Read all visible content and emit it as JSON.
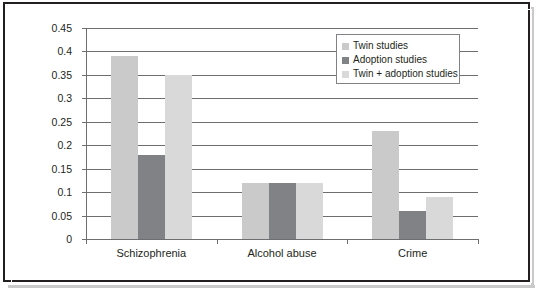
{
  "chart_data": {
    "type": "bar",
    "title": "",
    "subtitle": "",
    "xlabel": "",
    "ylabel": "",
    "categories": [
      "Schizophrenia",
      "Alcohol abuse",
      "Crime"
    ],
    "series": [
      {
        "name": "Twin studies",
        "values": [
          0.39,
          0.12,
          0.23
        ],
        "color": "#cacaca"
      },
      {
        "name": "Adoption studies",
        "values": [
          0.18,
          0.12,
          0.06
        ],
        "color": "#808285"
      },
      {
        "name": "Twin + adoption studies",
        "values": [
          0.35,
          0.12,
          0.09
        ],
        "color": "#d9d9d9"
      }
    ],
    "ylim": [
      0,
      0.45
    ],
    "ytick_labels": [
      "0",
      "0.05",
      "0.1",
      "0.15",
      "0.2",
      "0.25",
      "0.3",
      "0.35",
      "0.4",
      "0.45"
    ],
    "ytick_values": [
      0,
      0.05,
      0.1,
      0.15,
      0.2,
      0.25,
      0.3,
      0.35,
      0.4,
      0.45
    ],
    "grid": true,
    "legend_position": "top-right",
    "annotations": []
  },
  "legend": {
    "items": [
      {
        "label": "Twin studies"
      },
      {
        "label": "Adoption studies"
      },
      {
        "label": "Twin + adoption studies"
      }
    ]
  },
  "colors": {
    "series_1": "#cacaca",
    "series_2": "#808285",
    "series_3": "#d9d9d9",
    "axis": "#6d6e71",
    "text": "#231f20",
    "frame": "#231f20",
    "background": "#ffffff"
  }
}
